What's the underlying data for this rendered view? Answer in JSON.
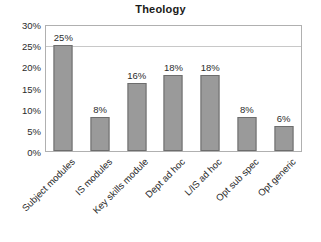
{
  "chart_data": {
    "type": "bar",
    "title": "Theology",
    "xlabel": "",
    "ylabel": "",
    "categories": [
      "Subject modules",
      "IS modules",
      "Key skills module",
      "Dept ad hoc",
      "L/IS ad hoc",
      "Opt sub spec",
      "Opt generic"
    ],
    "values": [
      25,
      8,
      16,
      18,
      18,
      8,
      6
    ],
    "value_labels": [
      "25%",
      "8%",
      "16%",
      "18%",
      "18%",
      "8%",
      "6%"
    ],
    "ylim": [
      0,
      30
    ],
    "ytick_labels": [
      "30%",
      "25%",
      "20%",
      "15%",
      "10%",
      "5%",
      "0%"
    ],
    "ytick_values": [
      30,
      25,
      20,
      15,
      10,
      5,
      0
    ],
    "gridlines": [
      25
    ],
    "grid": true,
    "legend": "none",
    "bar_color": "#9a9a9a",
    "bar_border_color": "#6d6d6d",
    "plot_border_color": "#b0b0b0",
    "text_color": "#2b2b2b",
    "background_color": "#ffffff"
  }
}
